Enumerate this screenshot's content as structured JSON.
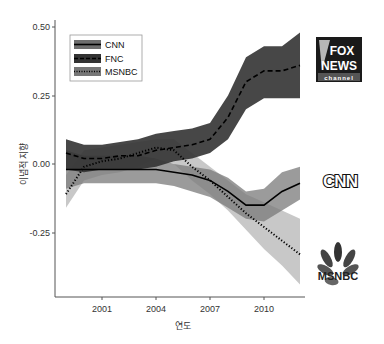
{
  "chart_data": {
    "type": "line",
    "title": "",
    "xlabel": "연도",
    "ylabel": "이념적 지향",
    "x_ticks": [
      "2001",
      "2004",
      "2007",
      "2010"
    ],
    "y_ticks": [
      "0.50",
      "0.25",
      "0.00",
      "-0.25"
    ],
    "xlim": [
      1999,
      2012.5
    ],
    "ylim": [
      -0.45,
      0.52
    ],
    "grid": false,
    "legend_position": "top-left",
    "x": [
      1999,
      2000,
      2001,
      2002,
      2003,
      2004,
      2005,
      2006,
      2007,
      2008,
      2009,
      2010,
      2011,
      2012
    ],
    "series": [
      {
        "name": "CNN",
        "line_style": "solid",
        "band_color": "#7a7a7a",
        "values": [
          -0.02,
          -0.02,
          -0.02,
          -0.02,
          -0.02,
          -0.02,
          -0.03,
          -0.04,
          -0.06,
          -0.1,
          -0.15,
          -0.15,
          -0.1,
          -0.07
        ],
        "upper": [
          0.05,
          0.03,
          0.03,
          0.03,
          0.03,
          0.02,
          0.0,
          -0.01,
          -0.02,
          -0.05,
          -0.1,
          -0.09,
          -0.03,
          -0.01
        ],
        "lower": [
          -0.09,
          -0.07,
          -0.07,
          -0.07,
          -0.07,
          -0.07,
          -0.08,
          -0.1,
          -0.12,
          -0.16,
          -0.2,
          -0.21,
          -0.17,
          -0.13
        ]
      },
      {
        "name": "FNC",
        "line_style": "dashed",
        "band_color": "#333333",
        "values": [
          0.04,
          0.02,
          0.02,
          0.03,
          0.03,
          0.05,
          0.06,
          0.07,
          0.09,
          0.17,
          0.3,
          0.34,
          0.34,
          0.36
        ],
        "upper": [
          0.09,
          0.07,
          0.07,
          0.08,
          0.09,
          0.11,
          0.12,
          0.13,
          0.15,
          0.25,
          0.39,
          0.43,
          0.43,
          0.48
        ],
        "lower": [
          -0.02,
          -0.03,
          -0.02,
          -0.02,
          -0.02,
          -0.01,
          0.01,
          0.02,
          0.04,
          0.09,
          0.2,
          0.24,
          0.24,
          0.24
        ]
      },
      {
        "name": "MSNBC",
        "line_style": "dotted",
        "band_color": "#b0b0b0",
        "values": [
          -0.11,
          -0.01,
          0.01,
          0.02,
          0.04,
          0.06,
          0.05,
          -0.01,
          -0.06,
          -0.12,
          -0.18,
          -0.23,
          -0.28,
          -0.33
        ],
        "upper": [
          -0.04,
          0.05,
          0.06,
          0.07,
          0.08,
          0.09,
          0.09,
          0.04,
          -0.01,
          -0.06,
          -0.11,
          -0.14,
          -0.17,
          -0.2
        ],
        "lower": [
          -0.16,
          -0.06,
          -0.04,
          -0.03,
          -0.01,
          0.02,
          0.0,
          -0.06,
          -0.11,
          -0.17,
          -0.24,
          -0.31,
          -0.37,
          -0.44
        ]
      }
    ],
    "annotations": [
      {
        "type": "logo",
        "label": "FOX NEWS channel",
        "position": "right of FNC line end"
      },
      {
        "type": "logo",
        "label": "CNN",
        "position": "right of CNN line end"
      },
      {
        "type": "logo",
        "label": "MSNBC",
        "position": "right of MSNBC line end"
      }
    ]
  },
  "legend": {
    "items": [
      {
        "label": "CNN"
      },
      {
        "label": "FNC"
      },
      {
        "label": "MSNBC"
      }
    ]
  },
  "logos": {
    "fox": {
      "line1": "FOX",
      "line2": "NEWS",
      "line3": "channel"
    },
    "cnn": {
      "text": "CNN"
    },
    "msnbc": {
      "text": "MSNBC"
    }
  },
  "axes": {
    "xlabel": "연도",
    "ylabel": "이념적 지향",
    "x_ticks": [
      "2001",
      "2004",
      "2007",
      "2010"
    ],
    "y_ticks": [
      "0.50",
      "0.25",
      "0.00",
      "-0.25"
    ]
  }
}
